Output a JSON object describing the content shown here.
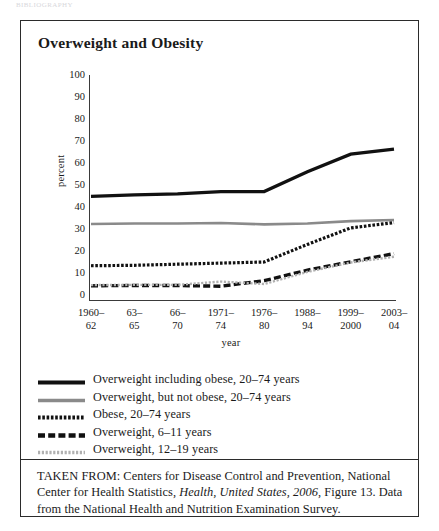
{
  "page": {
    "running_head": "BIBLIOGRAPHY"
  },
  "figure": {
    "title": "Overweight and Obesity",
    "source_prefix": "TAKEN FROM: Centers for Disease Control and Prevention, National Center for Health Statistics, ",
    "source_italic": "Health, United States, 2006",
    "source_suffix": ", Figure 13. Data from the National Health and Nutrition Examination Survey."
  },
  "legend": {
    "entries": [
      {
        "label": "Overweight including obese, 20–74 years",
        "style": "solid-thick-black",
        "color": "#111111"
      },
      {
        "label": "Overweight, but not obese, 20–74 years",
        "style": "solid-gray",
        "color": "#8a8a8a"
      },
      {
        "label": "Obese, 20–74 years",
        "style": "dotted-black",
        "color": "#111111"
      },
      {
        "label": "Overweight, 6–11 years",
        "style": "dashed-black",
        "color": "#111111"
      },
      {
        "label": "Overweight, 12–19 years",
        "style": "dotted-gray",
        "color": "#b0b0b0"
      }
    ]
  },
  "chart_data": {
    "type": "line",
    "title": "Overweight and Obesity",
    "xlabel": "year",
    "ylabel": "percent",
    "ylim": [
      0,
      100
    ],
    "yticks": [
      0,
      10,
      20,
      30,
      40,
      50,
      60,
      70,
      80,
      90,
      100
    ],
    "grid": false,
    "legend_position": "below-plot",
    "categories": [
      "1960–62",
      "63–65",
      "66–70",
      "1971–74",
      "1976–80",
      "1988–94",
      "1999–2000",
      "2003–04"
    ],
    "category_lines": [
      [
        "1960–",
        "62"
      ],
      [
        "63–",
        "65"
      ],
      [
        "66–",
        "70"
      ],
      [
        "1971–",
        "74"
      ],
      [
        "1976–",
        "80"
      ],
      [
        "1988–",
        "94"
      ],
      [
        "1999–",
        "2000"
      ],
      [
        "2003–",
        "04"
      ]
    ],
    "series": [
      {
        "name": "Overweight including obese, 20–74 years",
        "values": [
          44.8,
          45.5,
          46.0,
          47.0,
          47.0,
          56.0,
          64.0,
          66.3
        ],
        "color": "#111111",
        "style": "solid-thick-black"
      },
      {
        "name": "Overweight, but not obese, 20–74 years",
        "values": [
          32.3,
          32.5,
          32.5,
          32.7,
          32.1,
          32.5,
          33.6,
          34.1
        ],
        "color": "#8a8a8a",
        "style": "solid-gray"
      },
      {
        "name": "Obese, 20–74 years",
        "values": [
          13.3,
          13.5,
          14.0,
          14.5,
          15.0,
          23.0,
          30.5,
          32.9
        ],
        "color": "#111111",
        "style": "dotted-black"
      },
      {
        "name": "Overweight, 6–11 years",
        "values": [
          4.2,
          4.3,
          4.3,
          4.0,
          6.5,
          11.3,
          15.1,
          18.8
        ],
        "color": "#111111",
        "style": "dashed-black"
      },
      {
        "name": "Overweight, 12–19 years",
        "values": [
          4.5,
          4.6,
          4.6,
          6.1,
          5.0,
          10.5,
          14.8,
          17.4
        ],
        "color": "#b0b0b0",
        "style": "dotted-gray"
      }
    ]
  }
}
